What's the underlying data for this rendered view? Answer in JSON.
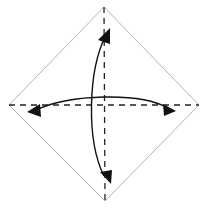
{
  "diagram": {
    "type": "origami-fold-diagram",
    "caption_cropped": "",
    "paper": {
      "shape": "square-rotated-45",
      "vertices": {
        "top": [
          104,
          7
        ],
        "right": [
          199,
          105
        ],
        "bottom": [
          105,
          201
        ],
        "left": [
          9,
          105
        ]
      },
      "stroke": "#b5b5b5",
      "fill": "#ffffff"
    },
    "folds": [
      {
        "name": "vertical-diagonal-valley-fold",
        "style": "dashed",
        "from": [
          104,
          7
        ],
        "to": [
          105,
          201
        ],
        "color": "#222222"
      },
      {
        "name": "horizontal-diagonal-valley-fold",
        "style": "dashed",
        "from": [
          9,
          105
        ],
        "to": [
          199,
          105
        ],
        "color": "#222222"
      }
    ],
    "arrows": [
      {
        "name": "vertical-fold-and-unfold-arrow",
        "direction": "top-bottom",
        "double_headed": true,
        "color": "#111111"
      },
      {
        "name": "horizontal-fold-and-unfold-arrow",
        "direction": "left-right",
        "double_headed": true,
        "color": "#111111"
      }
    ],
    "colors": {
      "outline": "#b5b5b5",
      "fold_line": "#222222",
      "arrow": "#111111",
      "background": "#ffffff"
    }
  }
}
